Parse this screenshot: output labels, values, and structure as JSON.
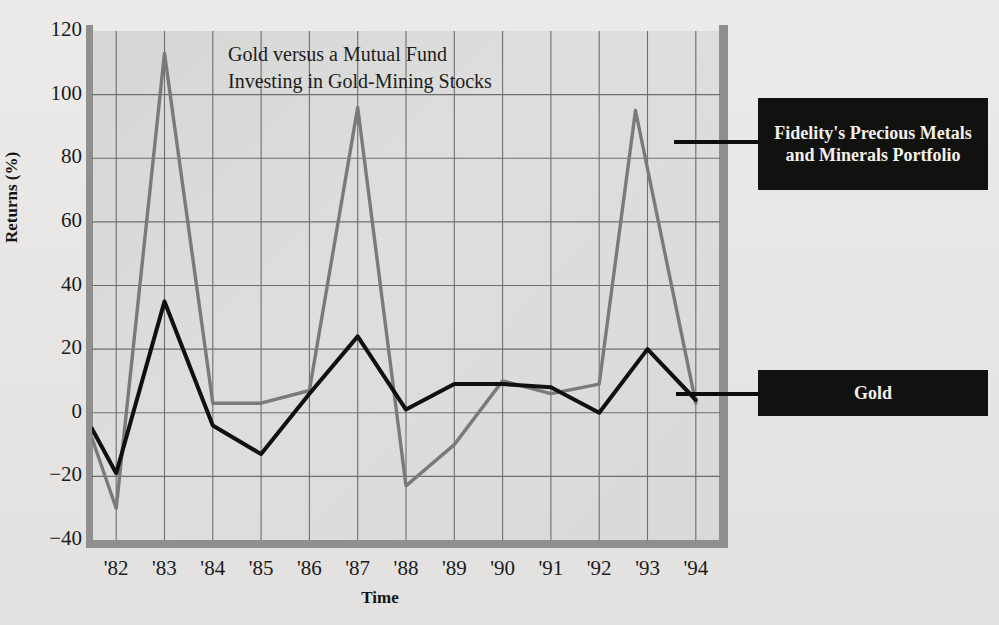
{
  "chart_data": {
    "type": "line",
    "title": "Gold versus a Mutual Fund Investing in Gold-Mining Stocks",
    "title_line1": "Gold versus a Mutual Fund",
    "title_line2": "Investing in Gold-Mining Stocks",
    "xlabel": "Time",
    "ylabel": "Returns (%)",
    "ylim": [
      -40,
      120
    ],
    "ytick_labels": [
      "120",
      "100",
      "80",
      "60",
      "40",
      "20",
      "0",
      "−20",
      "−40"
    ],
    "ytick_values": [
      120,
      100,
      80,
      60,
      40,
      20,
      0,
      -20,
      -40
    ],
    "xtick_labels": [
      "'82",
      "'83",
      "'84",
      "'85",
      "'86",
      "'87",
      "'88",
      "'89",
      "'90",
      "'91",
      "'92",
      "'93",
      "'94"
    ],
    "x": [
      1982,
      1983,
      1984,
      1985,
      1986,
      1987,
      1988,
      1989,
      1990,
      1991,
      1992,
      1993,
      1994
    ],
    "grid": true,
    "legend_position": "right-callouts",
    "series": [
      {
        "name": "Fidelity's Precious Metals and Minerals Portfolio",
        "color": "#7a7a78",
        "values": [
          -30,
          113,
          3,
          3,
          7,
          96,
          -23,
          -10,
          10,
          6,
          9,
          95,
          3
        ]
      },
      {
        "name": "Gold",
        "color": "#101010",
        "values": [
          -19,
          35,
          -4,
          -13,
          6,
          24,
          1,
          9,
          9,
          8,
          0,
          20,
          4
        ]
      }
    ],
    "start_value_gold": -5,
    "start_value_fidelity": -8
  },
  "legend": {
    "fidelity_label": "Fidelity's Precious Metals and Minerals Portfolio",
    "gold_label": "Gold"
  },
  "colors": {
    "gold_line": "#101010",
    "fidelity_line": "#7a7a78",
    "plot_background": "#d9d9d7",
    "page_background": "#e9e9e7",
    "axis": "#8f8f8f",
    "grid": "#6e6e6e",
    "legend_box": "#111110",
    "legend_text": "#f2f0ea"
  }
}
